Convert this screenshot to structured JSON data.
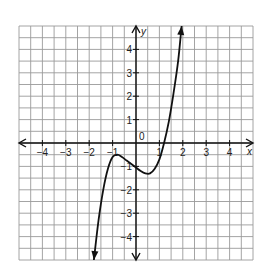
{
  "chart_data": {
    "type": "line",
    "title": "",
    "xlabel": "x",
    "ylabel": "y",
    "xlim": [
      -5,
      5
    ],
    "ylim": [
      -5,
      5
    ],
    "grid": true,
    "grid_step": 0.5,
    "x_ticks": [
      -4,
      -3,
      -2,
      -1,
      0,
      1,
      2,
      3,
      4
    ],
    "x_tick_labels": [
      "−4",
      "−3",
      "−2",
      "−1",
      "0",
      "1",
      "2",
      "3",
      "4"
    ],
    "y_ticks": [
      -4,
      -3,
      -2,
      -1,
      1,
      2,
      3,
      4
    ],
    "y_tick_labels": [
      "−4",
      "−3",
      "−2",
      "−1",
      "1",
      "2",
      "3",
      "4"
    ],
    "series": [
      {
        "name": "f(x)",
        "arrows_both_ends": true,
        "x": [
          -1.8,
          -1.6,
          -1.4,
          -1.2,
          -1.0,
          -0.8,
          -0.6,
          -0.4,
          -0.2,
          0.0,
          0.2,
          0.4,
          0.6,
          0.8,
          1.0,
          1.2,
          1.4,
          1.6,
          1.8,
          1.95
        ],
        "y": [
          -5.0,
          -3.3,
          -2.0,
          -1.1,
          -0.6,
          -0.5,
          -0.6,
          -0.75,
          -0.9,
          -1.05,
          -1.2,
          -1.3,
          -1.3,
          -1.1,
          -0.7,
          0.0,
          0.9,
          2.1,
          3.5,
          5.0
        ]
      }
    ],
    "annotations": {
      "origin_label": "0",
      "x_axis_name": "x",
      "y_axis_name": "y"
    }
  }
}
